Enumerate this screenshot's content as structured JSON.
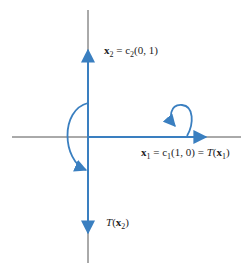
{
  "colors": {
    "axis": "#555555",
    "vector": "#3a7fc0",
    "text": "#222222"
  },
  "labels": {
    "x2": "x₂ = c₂(0, 1)",
    "x1": "x₁ = c₁(1, 0) = T(x₁)",
    "tx2": "T(x₂)"
  },
  "label_parts": {
    "x2_vec": "x",
    "x2_sub": "2",
    "x2_rest": " = c",
    "x2_csub": "2",
    "x2_tail": "(0, 1)",
    "x1_vec": "x",
    "x1_sub": "1",
    "x1_rest": " = c",
    "x1_csub": "1",
    "x1_mid": "(1, 0) = ",
    "x1_T": "T",
    "x1_open": "(",
    "x1_vec2": "x",
    "x1_sub2": "1",
    "x1_close": ")",
    "tx2_T": "T",
    "tx2_open": "(",
    "tx2_vec": "x",
    "tx2_sub": "2",
    "tx2_close": ")"
  },
  "elements": {
    "horizontal_axis": "x-axis",
    "vertical_axis": "y-axis",
    "vector_x1": "x1 vector along positive x-axis",
    "vector_x2": "x2 vector along positive y-axis",
    "vector_tx2": "T(x2) vector along negative y-axis",
    "reflection_arrow": "curved arrow from x2 to T(x2)",
    "fixed_loop_arrow": "loop arrow indicating x1 maps to itself"
  }
}
